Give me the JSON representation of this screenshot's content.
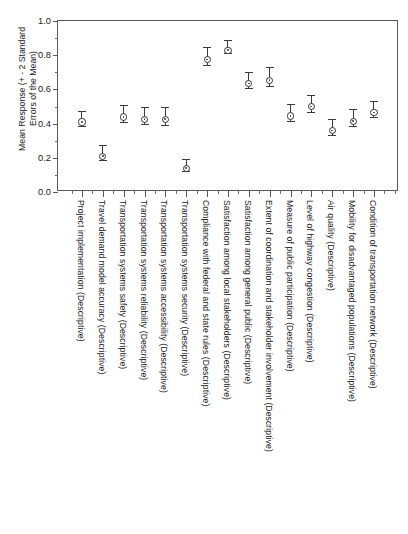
{
  "figure": {
    "cropped_title_ghost": "",
    "y_axis_label": "Mean Response (+ - 2 Standard\nErrors of the Mean)"
  },
  "chart_data": {
    "type": "scatter",
    "title": "",
    "xlabel": "",
    "ylabel": "Mean Response (+ - 2 Standard Errors of the Mean)",
    "ylim": [
      0.0,
      1.0
    ],
    "ytick_labels": [
      "0.0",
      "0.2",
      "0.4",
      "0.6",
      "0.8",
      "1.0"
    ],
    "ytick_values": [
      0.0,
      0.2,
      0.4,
      0.6,
      0.8,
      1.0
    ],
    "yminor_step": 0.1,
    "grid": false,
    "legend": "none",
    "error_bar_type": "+/- 2 standard errors of the mean",
    "categories": [
      "Project implementation (Descriptive)",
      "Travel demand model accuracy (Descriptive)",
      "Transportation systems safety (Descriptive)",
      "Transportation systems reliability (Descriptive)",
      "Transportation systems accessibility (Descriptive)",
      "Transportation systems security (Descriptive)",
      "Compliance with federal and state rules (Descriptive)",
      "Satisfaction among local stakeholders (Descriptive)",
      "Satisfaction among general public (Descriptive)",
      "Extent of coordination and stakeholder involvement (Descriptive)",
      "Measure of public participation (Descriptive)",
      "Level of highway congestion (Descriptive)",
      "Air quality (Descriptive)",
      "Mobility for disadvantaged populations (Descriptive)",
      "Condition of transportation network (Descriptive)"
    ],
    "values": [
      0.43,
      0.23,
      0.46,
      0.445,
      0.445,
      0.16,
      0.795,
      0.85,
      0.655,
      0.675,
      0.465,
      0.52,
      0.38,
      0.435,
      0.485
    ],
    "errors": [
      0.042,
      0.045,
      0.048,
      0.05,
      0.055,
      0.035,
      0.052,
      0.04,
      0.048,
      0.055,
      0.05,
      0.05,
      0.048,
      0.048,
      0.045
    ]
  }
}
